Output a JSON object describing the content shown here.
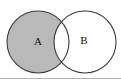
{
  "figure": {
    "kind": "venn-diagram",
    "width": 121,
    "height": 80,
    "background_color": "#ffffff",
    "bottom_rule_color": "#b0b0b0"
  },
  "style": {
    "outline_color": "#3a3a3a",
    "outline_width": 1.1,
    "shaded_fill": "#b9b9b9",
    "unshaded_fill": "#ffffff"
  },
  "sets": [
    {
      "id": "A",
      "label": "A",
      "cx": 38,
      "cy": 42,
      "r": 31,
      "fill": "#b9b9b9",
      "shaded": true,
      "label_x": 38,
      "label_y": 42
    },
    {
      "id": "B",
      "label": "B",
      "cx": 85,
      "cy": 42,
      "r": 31,
      "fill": "#ffffff",
      "shaded": false,
      "label_x": 84,
      "label_y": 41
    }
  ],
  "regions": [
    {
      "id": "A-only",
      "description": "A minus B",
      "shaded": true,
      "fill": "#b9b9b9"
    },
    {
      "id": "intersection",
      "description": "A intersect B",
      "shaded": false,
      "fill": "#ffffff"
    },
    {
      "id": "B-only",
      "description": "B minus A",
      "shaded": false,
      "fill": "#ffffff"
    }
  ]
}
